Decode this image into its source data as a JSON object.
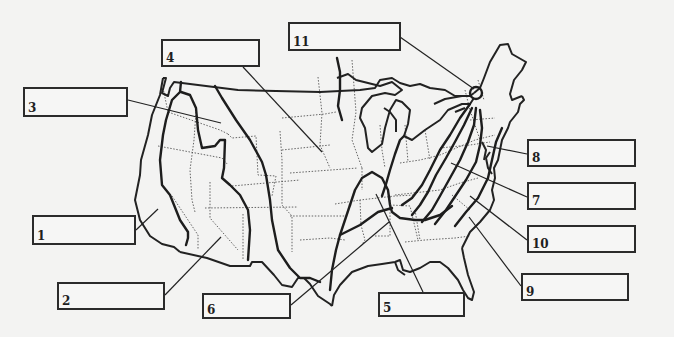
{
  "diagram": {
    "type": "physiographic-regions-map",
    "colors": {
      "background": "#f3f3f2",
      "ink": "#222222",
      "box_border": "#2b2b2b"
    },
    "labels": [
      {
        "number": "1",
        "box": {
          "x": 32,
          "y": 215,
          "w": 104,
          "h": 30
        },
        "leader_to": [
          158,
          209
        ],
        "answer": ""
      },
      {
        "number": "2",
        "box": {
          "x": 57,
          "y": 282,
          "w": 108,
          "h": 28
        },
        "leader_to": [
          221,
          237
        ],
        "answer": ""
      },
      {
        "number": "3",
        "box": {
          "x": 23,
          "y": 87,
          "w": 105,
          "h": 30
        },
        "leader_to": [
          221,
          123
        ],
        "answer": ""
      },
      {
        "number": "4",
        "box": {
          "x": 161,
          "y": 39,
          "w": 99,
          "h": 28
        },
        "leader_to": [
          322,
          152
        ],
        "answer": ""
      },
      {
        "number": "5",
        "box": {
          "x": 378,
          "y": 292,
          "w": 87,
          "h": 25
        },
        "leader_to": [
          376,
          194
        ],
        "answer": ""
      },
      {
        "number": "6",
        "box": {
          "x": 202,
          "y": 293,
          "w": 89,
          "h": 26
        },
        "leader_to": [
          389,
          222
        ],
        "answer": ""
      },
      {
        "number": "7",
        "box": {
          "x": 527,
          "y": 182,
          "w": 109,
          "h": 28
        },
        "leader_to": [
          451,
          163
        ],
        "answer": ""
      },
      {
        "number": "8",
        "box": {
          "x": 527,
          "y": 139,
          "w": 109,
          "h": 28
        },
        "leader_to": [
          487,
          146
        ],
        "answer": ""
      },
      {
        "number": "9",
        "box": {
          "x": 521,
          "y": 273,
          "w": 108,
          "h": 28
        },
        "leader_to": [
          469,
          217
        ],
        "answer": ""
      },
      {
        "number": "10",
        "box": {
          "x": 527,
          "y": 225,
          "w": 109,
          "h": 28
        },
        "leader_to": [
          470,
          196
        ],
        "answer": ""
      },
      {
        "number": "11",
        "box": {
          "x": 288,
          "y": 22,
          "w": 113,
          "h": 29
        },
        "leader_to": [
          474,
          93
        ],
        "answer": ""
      }
    ]
  }
}
